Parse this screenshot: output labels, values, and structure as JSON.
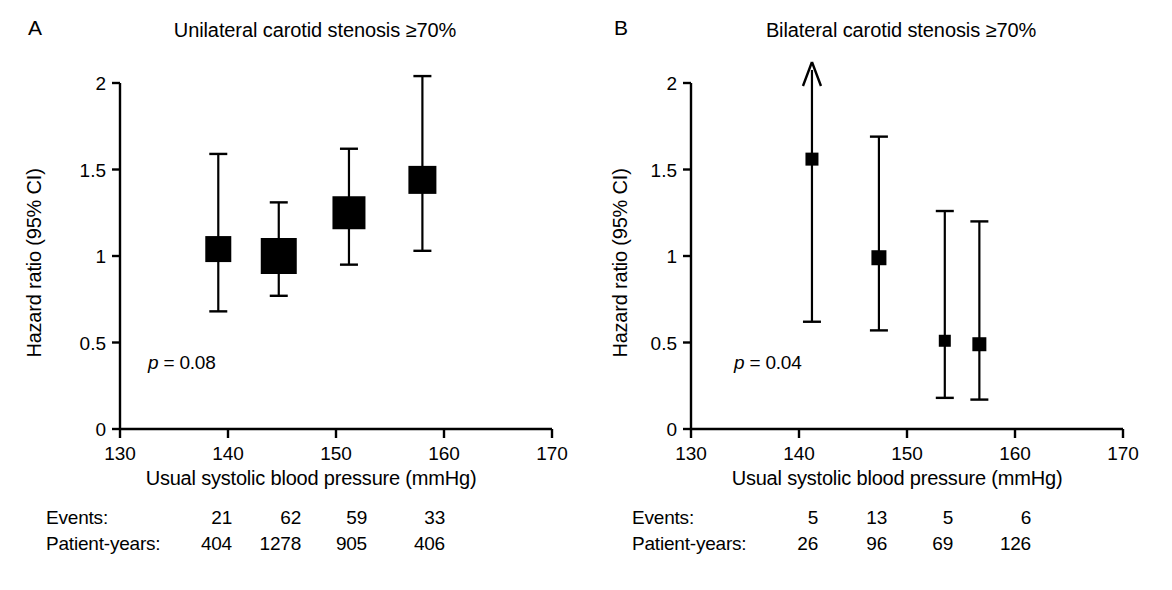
{
  "figure": {
    "background": "#ffffff",
    "ink_color": "#000000",
    "width": 1172,
    "height": 590
  },
  "panels": [
    {
      "letter": "A",
      "title": "Unilateral carotid stenosis ≥70%",
      "pvalue_prefix": "p",
      "pvalue_text": " = 0.08",
      "counts": {
        "row1_label": "Events:",
        "row2_label": "Patient-years:",
        "row1_values": [
          "21",
          "62",
          "59",
          "33"
        ],
        "row2_values": [
          "404",
          "1278",
          "905",
          "406"
        ]
      },
      "chart_data": {
        "type": "scatter",
        "title": "Unilateral carotid stenosis ≥70%",
        "xlabel": "Usual systolic blood pressure (mmHg)",
        "ylabel": "Hazard ratio (95% CI)",
        "xlim": [
          130,
          170
        ],
        "ylim": [
          0,
          2
        ],
        "xticks": [
          130,
          140,
          150,
          160,
          170
        ],
        "yticks": [
          0,
          0.5,
          1,
          1.5,
          2
        ],
        "grid": false,
        "legend": "none",
        "annotation": "p = 0.08",
        "points": [
          {
            "x": 139.1,
            "hr": 1.04,
            "ci_low": 0.68,
            "ci_high": 1.59,
            "box_size": 26,
            "arrow_up": false,
            "events": 21,
            "patient_years": 404
          },
          {
            "x": 144.7,
            "hr": 1.0,
            "ci_low": 0.77,
            "ci_high": 1.31,
            "box_size": 36,
            "arrow_up": false,
            "events": 62,
            "patient_years": 1278
          },
          {
            "x": 151.2,
            "hr": 1.25,
            "ci_low": 0.95,
            "ci_high": 1.62,
            "box_size": 33,
            "arrow_up": false,
            "events": 59,
            "patient_years": 905
          },
          {
            "x": 158.0,
            "hr": 1.44,
            "ci_low": 1.03,
            "ci_high": 2.04,
            "box_size": 28,
            "arrow_up": false,
            "events": 33,
            "patient_years": 406
          }
        ]
      }
    },
    {
      "letter": "B",
      "title": "Bilateral carotid stenosis ≥70%",
      "pvalue_prefix": "p",
      "pvalue_text": " = 0.04",
      "counts": {
        "row1_label": "Events:",
        "row2_label": "Patient-years:",
        "row1_values": [
          "5",
          "13",
          "5",
          "6"
        ],
        "row2_values": [
          "26",
          "96",
          "69",
          "126"
        ]
      },
      "chart_data": {
        "type": "scatter",
        "title": "Bilateral carotid stenosis ≥70%",
        "xlabel": "Usual systolic blood pressure (mmHg)",
        "ylabel": "Hazard ratio (95% CI)",
        "xlim": [
          130,
          170
        ],
        "ylim": [
          0,
          2
        ],
        "xticks": [
          130,
          140,
          150,
          160,
          170
        ],
        "yticks": [
          0,
          0.5,
          1,
          1.5,
          2
        ],
        "grid": false,
        "legend": "none",
        "annotation": "p = 0.04",
        "points": [
          {
            "x": 141.2,
            "hr": 1.56,
            "ci_low": 0.62,
            "ci_high": 2.18,
            "box_size": 13,
            "arrow_up": true,
            "events": 5,
            "patient_years": 26
          },
          {
            "x": 147.4,
            "hr": 0.99,
            "ci_low": 0.57,
            "ci_high": 1.69,
            "box_size": 15,
            "arrow_up": false,
            "events": 13,
            "patient_years": 96
          },
          {
            "x": 153.5,
            "hr": 0.51,
            "ci_low": 0.18,
            "ci_high": 1.26,
            "box_size": 12,
            "arrow_up": false,
            "events": 5,
            "patient_years": 69
          },
          {
            "x": 156.7,
            "hr": 0.49,
            "ci_low": 0.17,
            "ci_high": 1.2,
            "box_size": 14,
            "arrow_up": false,
            "events": 6,
            "patient_years": 126
          }
        ]
      }
    }
  ],
  "axis": {
    "x_tick_labels": [
      "130",
      "140",
      "150",
      "160",
      "170"
    ],
    "y_tick_labels": [
      "0",
      "0.5",
      "1",
      "1.5",
      "2"
    ],
    "x_title": "Usual systolic blood pressure (mmHg)",
    "y_title": "Hazard ratio (95% CI)"
  }
}
